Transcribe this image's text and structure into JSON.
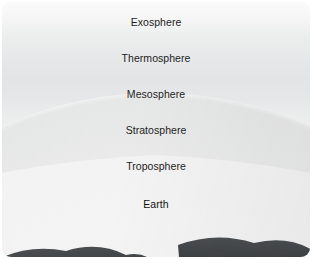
{
  "figure": {
    "type": "labeled-diagram",
    "background_color": "#ffffff",
    "card": {
      "corner_radius_px": 9,
      "sky_top_color": "#fbfbfb",
      "sky_bottom_color": "#d6d8db",
      "globe_highlight_color": "#f2f3f3",
      "globe_edge_color": "#7d8184",
      "land_color": "#3c3f41",
      "cloud_color": "#fafafa",
      "label_color": "#1d1d1d"
    },
    "labels": [
      {
        "id": "exosphere",
        "text": "Exosphere"
      },
      {
        "id": "thermosphere",
        "text": "Thermosphere"
      },
      {
        "id": "mesosphere",
        "text": "Mesosphere"
      },
      {
        "id": "stratosphere",
        "text": "Stratosphere"
      },
      {
        "id": "troposphere",
        "text": "Troposphere"
      },
      {
        "id": "earth",
        "text": "Earth"
      }
    ]
  }
}
